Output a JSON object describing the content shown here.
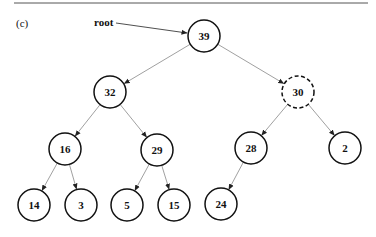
{
  "figure": {
    "panel_label": "(c)",
    "root_pointer_label": "root"
  },
  "tree": {
    "nodes": [
      {
        "id": "n39",
        "value": "39",
        "x": 204,
        "y": 36,
        "style": "solid"
      },
      {
        "id": "n32",
        "value": "32",
        "x": 110,
        "y": 92,
        "style": "solid"
      },
      {
        "id": "n30",
        "value": "30",
        "x": 298,
        "y": 92,
        "style": "dashed"
      },
      {
        "id": "n16",
        "value": "16",
        "x": 65,
        "y": 149,
        "style": "solid"
      },
      {
        "id": "n29",
        "value": "29",
        "x": 157,
        "y": 150,
        "style": "solid"
      },
      {
        "id": "n28",
        "value": "28",
        "x": 251,
        "y": 148,
        "style": "solid"
      },
      {
        "id": "n2",
        "value": "2",
        "x": 345,
        "y": 148,
        "style": "solid"
      },
      {
        "id": "n14",
        "value": "14",
        "x": 34,
        "y": 205,
        "style": "solid"
      },
      {
        "id": "n3",
        "value": "3",
        "x": 81,
        "y": 205,
        "style": "solid"
      },
      {
        "id": "n5",
        "value": "5",
        "x": 127,
        "y": 205,
        "style": "solid"
      },
      {
        "id": "n15",
        "value": "15",
        "x": 174,
        "y": 205,
        "style": "solid"
      },
      {
        "id": "n24",
        "value": "24",
        "x": 221,
        "y": 204,
        "style": "solid"
      }
    ],
    "edges": [
      [
        "n39",
        "n32"
      ],
      [
        "n39",
        "n30"
      ],
      [
        "n32",
        "n16"
      ],
      [
        "n32",
        "n29"
      ],
      [
        "n30",
        "n28"
      ],
      [
        "n30",
        "n2"
      ],
      [
        "n16",
        "n14"
      ],
      [
        "n16",
        "n3"
      ],
      [
        "n29",
        "n5"
      ],
      [
        "n29",
        "n15"
      ],
      [
        "n28",
        "n24"
      ]
    ]
  }
}
